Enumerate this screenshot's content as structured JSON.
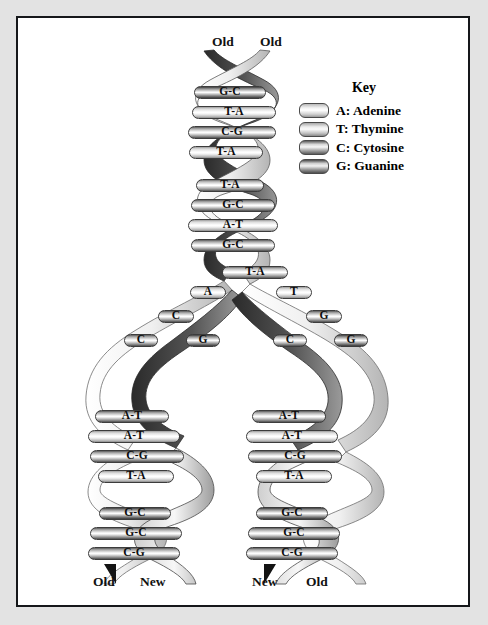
{
  "figure": {
    "top_labels": [
      {
        "text": "Old",
        "x": 194,
        "y": 22
      },
      {
        "text": "Old",
        "x": 242,
        "y": 22
      }
    ],
    "bottom_labels": [
      {
        "text": "Old",
        "x": 75,
        "y": 558
      },
      {
        "text": "New",
        "x": 122,
        "y": 558
      },
      {
        "text": "New",
        "x": 234,
        "y": 558
      },
      {
        "text": "Old",
        "x": 288,
        "y": 558
      }
    ]
  },
  "key": {
    "title": "Key",
    "items": [
      {
        "code": "A",
        "label": "A: Adenine",
        "swatch": "sw-A"
      },
      {
        "code": "T",
        "label": "T: Thymine",
        "swatch": "sw-T"
      },
      {
        "code": "C",
        "label": "C: Cytosine",
        "swatch": "sw-C"
      },
      {
        "code": "G",
        "label": "G: Guanine",
        "swatch": "sw-G"
      }
    ]
  },
  "chart_data": {
    "type": "diagram",
    "parent_helix": {
      "label_left": "Old",
      "label_right": "Old",
      "base_pairs": [
        "G-C",
        "T-A",
        "C-G",
        "T-A",
        "T-A",
        "G-C",
        "A-T",
        "G-C",
        "T-A"
      ]
    },
    "replication_fork": {
      "left_unpaired": [
        "A",
        "C",
        "C",
        "G"
      ],
      "right_unpaired": [
        "T",
        "G",
        "C",
        "G"
      ]
    },
    "daughter_left": {
      "label_left": "Old",
      "label_right": "New",
      "base_pairs": [
        "A-T",
        "A-T",
        "C-G",
        "T-A",
        "G-C",
        "G-C",
        "C-G"
      ]
    },
    "daughter_right": {
      "label_left": "New",
      "label_right": "Old",
      "base_pairs": [
        "A-T",
        "A-T",
        "C-G",
        "T-A",
        "G-C",
        "G-C",
        "C-G"
      ]
    }
  },
  "rungs": {
    "parent": [
      {
        "t": "G-C",
        "x": 176,
        "y": 68,
        "w": 72,
        "s": "r-dark"
      },
      {
        "t": "T-A",
        "x": 174,
        "y": 88,
        "w": 84,
        "s": "r-light"
      },
      {
        "t": "C-G",
        "x": 170,
        "y": 108,
        "w": 88,
        "s": "r-half"
      },
      {
        "t": "T-A",
        "x": 171,
        "y": 128,
        "w": 74,
        "s": "r-light"
      },
      {
        "t": "T-A",
        "x": 178,
        "y": 161,
        "w": 68,
        "s": "r-pair"
      },
      {
        "t": "G-C",
        "x": 173,
        "y": 181,
        "w": 84,
        "s": "r-half"
      },
      {
        "t": "A-T",
        "x": 170,
        "y": 201,
        "w": 90,
        "s": "r-light"
      },
      {
        "t": "G-C",
        "x": 173,
        "y": 221,
        "w": 84,
        "s": "r-half"
      },
      {
        "t": "T-A",
        "x": 204,
        "y": 248,
        "w": 66,
        "s": "r-pair"
      }
    ],
    "fork_left": [
      {
        "t": "A",
        "x": 172,
        "y": 268,
        "w": 36,
        "s": "r-light"
      },
      {
        "t": "C",
        "x": 140,
        "y": 292,
        "w": 36,
        "s": "r-half"
      },
      {
        "t": "C",
        "x": 106,
        "y": 316,
        "w": 34,
        "s": "r-half"
      },
      {
        "t": "G",
        "x": 168,
        "y": 316,
        "w": 34,
        "s": "r-dark"
      }
    ],
    "fork_right": [
      {
        "t": "T",
        "x": 258,
        "y": 268,
        "w": 36,
        "s": "r-light"
      },
      {
        "t": "G",
        "x": 288,
        "y": 292,
        "w": 36,
        "s": "r-half"
      },
      {
        "t": "C",
        "x": 255,
        "y": 316,
        "w": 34,
        "s": "r-half"
      },
      {
        "t": "G",
        "x": 316,
        "y": 316,
        "w": 34,
        "s": "r-dark"
      }
    ],
    "left_daughter": [
      {
        "t": "A-T",
        "x": 77,
        "y": 392,
        "w": 74,
        "s": "r-half"
      },
      {
        "t": "A-T",
        "x": 70,
        "y": 412,
        "w": 92,
        "s": "r-light"
      },
      {
        "t": "C-G",
        "x": 72,
        "y": 432,
        "w": 94,
        "s": "r-half"
      },
      {
        "t": "T-A",
        "x": 80,
        "y": 452,
        "w": 76,
        "s": "r-light"
      },
      {
        "t": "G-C",
        "x": 81,
        "y": 489,
        "w": 72,
        "s": "r-dark"
      },
      {
        "t": "G-C",
        "x": 72,
        "y": 509,
        "w": 92,
        "s": "r-half"
      },
      {
        "t": "C-G",
        "x": 70,
        "y": 529,
        "w": 92,
        "s": "r-half"
      }
    ],
    "right_daughter": [
      {
        "t": "A-T",
        "x": 234,
        "y": 392,
        "w": 74,
        "s": "r-half"
      },
      {
        "t": "A-T",
        "x": 228,
        "y": 412,
        "w": 92,
        "s": "r-light"
      },
      {
        "t": "C-G",
        "x": 230,
        "y": 432,
        "w": 94,
        "s": "r-half"
      },
      {
        "t": "T-A",
        "x": 238,
        "y": 452,
        "w": 76,
        "s": "r-light"
      },
      {
        "t": "G-C",
        "x": 238,
        "y": 489,
        "w": 72,
        "s": "r-dark"
      },
      {
        "t": "G-C",
        "x": 230,
        "y": 509,
        "w": 92,
        "s": "r-half"
      },
      {
        "t": "C-G",
        "x": 228,
        "y": 529,
        "w": 92,
        "s": "r-half"
      }
    ]
  }
}
